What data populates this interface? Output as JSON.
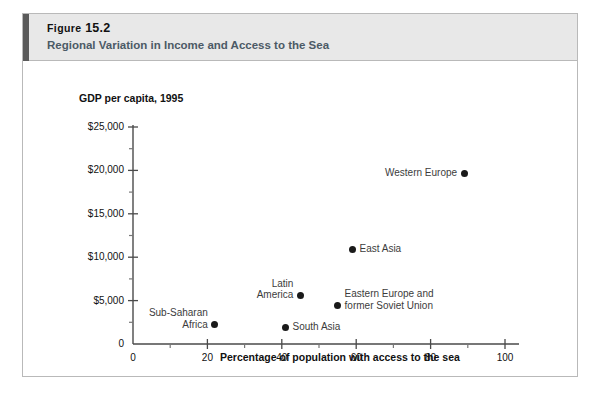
{
  "figure": {
    "number_prefix": "Figure",
    "number": "15.2",
    "title": "Regional Variation in Income and Access to the Sea"
  },
  "chart_data": {
    "type": "scatter",
    "title": "Regional Variation in Income and Access to the Sea",
    "xlabel": "Percentage of population with access to the sea",
    "ylabel": "GDP per capita, 1995",
    "xlim": [
      0,
      100
    ],
    "ylim": [
      0,
      25000
    ],
    "grid": false,
    "legend": "none",
    "x_ticks": [
      "0",
      "20",
      "40",
      "60",
      "80",
      "100"
    ],
    "x_tick_values": [
      0,
      20,
      40,
      60,
      80,
      100
    ],
    "x_minor_tick_values": [
      10,
      30,
      50,
      70,
      90
    ],
    "y_ticks": [
      "0",
      "$5,000",
      "$10,000",
      "$15,000",
      "$20,000",
      "$25,000"
    ],
    "y_tick_values": [
      0,
      5000,
      10000,
      15000,
      20000,
      25000
    ],
    "y_minor_tick_values": [
      2500,
      7500,
      12500,
      17500,
      22500
    ],
    "points": [
      {
        "name": "Sub-Saharan Africa",
        "label_lines": [
          "Sub-Saharan",
          "Africa"
        ],
        "label_side": "left",
        "x": 22,
        "y": 2200
      },
      {
        "name": "South Asia",
        "label_lines": [
          "South Asia"
        ],
        "label_side": "right",
        "x": 41,
        "y": 1950
      },
      {
        "name": "Latin America",
        "label_lines": [
          "Latin",
          "America"
        ],
        "label_side": "left",
        "x": 45,
        "y": 5600
      },
      {
        "name": "Eastern Europe and former Soviet Union",
        "label_lines": [
          "Eastern Europe and",
          "former Soviet Union"
        ],
        "label_side": "right",
        "x": 55,
        "y": 4400
      },
      {
        "name": "East Asia",
        "label_lines": [
          "East Asia"
        ],
        "label_side": "right",
        "x": 59,
        "y": 10900
      },
      {
        "name": "Western Europe",
        "label_lines": [
          "Western Europe"
        ],
        "label_side": "left",
        "x": 89,
        "y": 19700
      }
    ]
  }
}
